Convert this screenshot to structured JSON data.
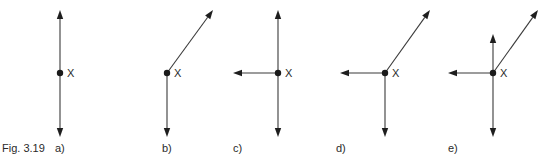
{
  "figure": {
    "caption": "Fig. 3.19",
    "point_label": "X",
    "colors": {
      "line": "#3a3a3a",
      "arrowhead": "#1e1e1e",
      "text": "#2a2a2a",
      "background": "#ffffff"
    },
    "panels": [
      {
        "label": "a)",
        "point": [
          60,
          73
        ],
        "label_pos": [
          55,
          152
        ],
        "vectors": [
          {
            "direction": "up",
            "tip": [
              60,
              10
            ]
          },
          {
            "direction": "down",
            "tip": [
              60,
              137
            ]
          }
        ]
      },
      {
        "label": "b)",
        "point": [
          167,
          73
        ],
        "label_pos": [
          162,
          152
        ],
        "vectors": [
          {
            "direction": "up-right",
            "tip": [
              213,
              10
            ]
          },
          {
            "direction": "down",
            "tip": [
              167,
              137
            ]
          }
        ]
      },
      {
        "label": "c)",
        "point": [
          278,
          73
        ],
        "label_pos": [
          233,
          152
        ],
        "vectors": [
          {
            "direction": "up",
            "tip": [
              278,
              10
            ]
          },
          {
            "direction": "left",
            "tip": [
              233,
              73
            ]
          },
          {
            "direction": "down",
            "tip": [
              278,
              137
            ]
          }
        ]
      },
      {
        "label": "d)",
        "point": [
          385,
          73
        ],
        "label_pos": [
          336,
          152
        ],
        "vectors": [
          {
            "direction": "up-right",
            "tip": [
              430,
              10
            ]
          },
          {
            "direction": "left",
            "tip": [
              340,
              73
            ]
          },
          {
            "direction": "down",
            "tip": [
              385,
              137
            ]
          }
        ]
      },
      {
        "label": "e)",
        "point": [
          493,
          73
        ],
        "label_pos": [
          448,
          152
        ],
        "vectors": [
          {
            "direction": "up",
            "tip": [
              493,
              34
            ]
          },
          {
            "direction": "up-right",
            "tip": [
              538,
              10
            ]
          },
          {
            "direction": "left",
            "tip": [
              448,
              73
            ]
          },
          {
            "direction": "down",
            "tip": [
              493,
              137
            ]
          }
        ]
      }
    ]
  }
}
